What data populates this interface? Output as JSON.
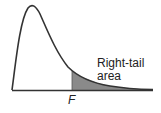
{
  "diagram": {
    "curve": "right-skewed F density",
    "labels": {
      "area_line1": "Right-tail",
      "area_line2": "area",
      "critical_value": "F"
    },
    "colors": {
      "curve": "#333333",
      "shaded_area": "#8a8a8a",
      "baseline": "#333333"
    }
  }
}
